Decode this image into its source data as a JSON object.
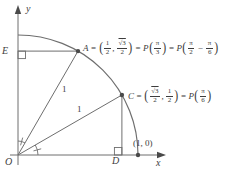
{
  "colors": {
    "line": "#6e6e6e",
    "text": "#3d3d3d",
    "background": "#ffffff"
  },
  "sym": {
    "eq": "=",
    "open": "(",
    "close": ")",
    "comma": ",",
    "minus": "−"
  },
  "axes": {
    "y_label": "y",
    "x_label": "x",
    "origin_label": "O"
  },
  "points": {
    "E_label": "E",
    "D_label": "D",
    "unit_point_label": "(1, 0)"
  },
  "radii": {
    "OA_length_label": "1",
    "OC_length_label": "1"
  },
  "point_A": {
    "name": "A",
    "x_num": "1",
    "x_den": "2",
    "y_num": "√3",
    "y_den": "2",
    "P1": "P",
    "arg_num": "π",
    "arg_den": "3",
    "P2": "P",
    "alt1_num": "π",
    "alt1_den": "2",
    "alt2_num": "π",
    "alt2_den": "6"
  },
  "point_C": {
    "name": "C",
    "x_num": "√3",
    "x_den": "2",
    "y_num": "1",
    "y_den": "2",
    "P": "P",
    "arg_num": "π",
    "arg_den": "6"
  }
}
